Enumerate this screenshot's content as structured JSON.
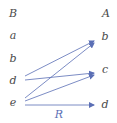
{
  "diagram": {
    "relation_label": "R",
    "left_set": {
      "title": "B",
      "elements": [
        "a",
        "b",
        "d",
        "e"
      ]
    },
    "right_set": {
      "title": "A",
      "elements": [
        "b",
        "c",
        "d"
      ]
    },
    "arrows": [
      {
        "from": "d",
        "to": "b"
      },
      {
        "from": "d",
        "to": "c"
      },
      {
        "from": "e",
        "to": "b"
      },
      {
        "from": "e",
        "to": "c"
      },
      {
        "from": "e",
        "to": "d"
      }
    ],
    "colors": {
      "arrow": "#5b6fb5",
      "text": "#4a4a4a"
    }
  }
}
